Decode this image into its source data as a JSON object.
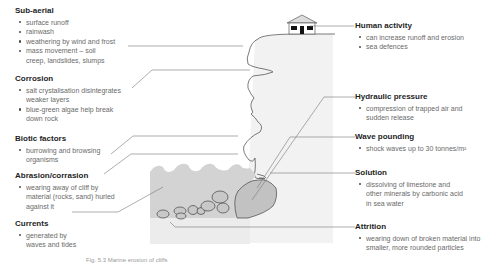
{
  "diagram": {
    "type": "coastal-erosion-processes",
    "left_labels": [
      {
        "title": "Sub-aerial",
        "bullets": [
          "surface runoff",
          "rainwash",
          "weathering by wind and frost",
          "mass movement – soil creep, landslides, slumps"
        ]
      },
      {
        "title": "Corrosion",
        "bullets": [
          "salt crystalisation disintegrates weaker layers",
          "blue-green algae help break down rock"
        ]
      },
      {
        "title": "Biotic factors",
        "bullets": [
          "burrowing and browsing organisms"
        ]
      },
      {
        "title": "Abrasion/corrasion",
        "bullets": [
          "wearing away of cliff by material (rocks, sand) hurled against it"
        ]
      },
      {
        "title": "Currents",
        "bullets": [
          "generated by waves and tides"
        ]
      }
    ],
    "right_labels": [
      {
        "title": "Human activity",
        "bullets": [
          "can increase runoff and erosion",
          "sea defences"
        ]
      },
      {
        "title": "Hydraulic pressure",
        "bullets": [
          "compression of trapped air and sudden release"
        ]
      },
      {
        "title": "Wave pounding",
        "bullets": [
          "shock waves up to 30 tonnes/m²"
        ]
      },
      {
        "title": "Solution",
        "bullets": [
          "dissolving of limestone and other minerals by carbonic acid in sea water"
        ]
      },
      {
        "title": "Attrition",
        "bullets": [
          "wearing down of broken material into smaller, more rounded particles"
        ]
      }
    ],
    "caption": "Fig. 5.3  Marine erosion of cliffs",
    "colors": {
      "cliff_fill": "#f2f2f2",
      "sea_fill": "#d3d3d3",
      "beach_fill": "#eeeeee",
      "boulder_fill": "#c2c2c2",
      "outline": "#444444",
      "leader_line": "#777777",
      "heading_text": "#1e1e1e",
      "body_text": "#6a6a6a"
    }
  }
}
